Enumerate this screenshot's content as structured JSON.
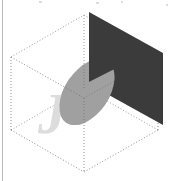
{
  "figure": {
    "canvas": {
      "width": 171,
      "height": 181,
      "background": "#ffffff"
    },
    "colors": {
      "wireframe": "#9a9a9a",
      "dark_plane": "#3a3a3a",
      "disk": "#9d9d9d",
      "disk_occluded": "#b0b0b0",
      "watermark": "#d9d9d9",
      "rule": "#b9b9b9"
    },
    "elements": [
      {
        "name": "wireframe-box",
        "kind": "dotted isometric cuboid",
        "stroke": "#9a9a9a",
        "dash": "1,2"
      },
      {
        "name": "dark-plane",
        "kind": "filled parallelogram",
        "fill": "#3a3a3a"
      },
      {
        "name": "gray-disk",
        "kind": "tilted filled ellipse",
        "fill": "#9d9d9d"
      },
      {
        "name": "watermark-letter",
        "kind": "letter glyph",
        "text": "J",
        "fill": "#d9d9d9"
      },
      {
        "name": "left-margin-rule",
        "kind": "vertical line",
        "stroke": "#b9b9b9"
      }
    ],
    "watermark": {
      "text": "J"
    }
  },
  "geometry": {
    "box_vertices": {
      "front_left": [
        11,
        57
      ],
      "front_left_b": [
        11,
        130
      ],
      "front_bottom": [
        84,
        172
      ],
      "front_mid_t": [
        84,
        98
      ],
      "right": [
        158,
        130
      ],
      "right_t": [
        158,
        57
      ],
      "back_top": [
        84,
        15
      ],
      "back_mid": [
        84,
        88
      ]
    },
    "dark_plane": [
      [
        89,
        12
      ],
      [
        163,
        53
      ],
      [
        163,
        125
      ],
      [
        89,
        84
      ]
    ],
    "disk": {
      "cx": 87,
      "cy": 92,
      "rx": 36,
      "ry": 22,
      "rotation_deg": -35
    }
  }
}
